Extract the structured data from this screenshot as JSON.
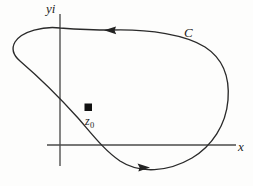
{
  "figure": {
    "type": "contour-diagram",
    "background_color": "#fdfdfc",
    "ink_color": "#2a2a2a",
    "axis_color": "#4a4a4a"
  },
  "axes": {
    "vertical_label": "yi",
    "horizontal_label": "x",
    "origin": {
      "x": 60,
      "y": 145
    },
    "vertical_extent": {
      "y_top": 14,
      "y_bottom": 166
    },
    "horizontal_extent": {
      "x_left": 47,
      "x_right": 236
    }
  },
  "contour": {
    "label": "C",
    "orientation": "counterclockwise",
    "closed": true,
    "arrows": [
      {
        "name": "top-arrow",
        "direction": "left",
        "x": 112,
        "y": 30
      },
      {
        "name": "bottom-arrow",
        "direction": "right",
        "x": 140,
        "y": 167
      }
    ],
    "extremes": {
      "leftmost_x": 13,
      "rightmost_x": 228,
      "topmost_y": 26,
      "bottommost_y": 170
    }
  },
  "marked_point": {
    "label": "z",
    "subscript": "0",
    "marker": "filled-square",
    "position": {
      "x": 88,
      "y": 107
    },
    "size": 7
  }
}
